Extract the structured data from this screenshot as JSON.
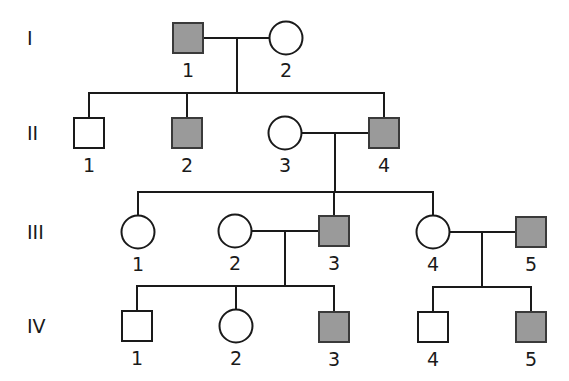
{
  "diagram": {
    "type": "pedigree",
    "colors": {
      "affected_fill": "#9a9a9a",
      "unaffected_fill": "#ffffff",
      "stroke": "#1a1a1a"
    },
    "generations": [
      {
        "label": "I",
        "y": 38
      },
      {
        "label": "II",
        "y": 133
      },
      {
        "label": "III",
        "y": 232
      },
      {
        "label": "IV",
        "y": 326
      }
    ],
    "individuals": [
      {
        "id": "I-1",
        "gen": "I",
        "num": "1",
        "sex": "male",
        "affected": true,
        "x": 188,
        "y": 38
      },
      {
        "id": "I-2",
        "gen": "I",
        "num": "2",
        "sex": "female",
        "affected": false,
        "x": 286,
        "y": 38
      },
      {
        "id": "II-1",
        "gen": "II",
        "num": "1",
        "sex": "male",
        "affected": false,
        "x": 89,
        "y": 133
      },
      {
        "id": "II-2",
        "gen": "II",
        "num": "2",
        "sex": "male",
        "affected": true,
        "x": 187,
        "y": 133
      },
      {
        "id": "II-3",
        "gen": "II",
        "num": "3",
        "sex": "female",
        "affected": false,
        "x": 285,
        "y": 133
      },
      {
        "id": "II-4",
        "gen": "II",
        "num": "4",
        "sex": "male",
        "affected": true,
        "x": 384,
        "y": 133
      },
      {
        "id": "III-1",
        "gen": "III",
        "num": "1",
        "sex": "female",
        "affected": false,
        "x": 138,
        "y": 232
      },
      {
        "id": "III-2",
        "gen": "III",
        "num": "2",
        "sex": "female",
        "affected": false,
        "x": 235,
        "y": 231
      },
      {
        "id": "III-3",
        "gen": "III",
        "num": "3",
        "sex": "male",
        "affected": true,
        "x": 334,
        "y": 231
      },
      {
        "id": "III-4",
        "gen": "III",
        "num": "4",
        "sex": "female",
        "affected": false,
        "x": 433,
        "y": 232
      },
      {
        "id": "III-5",
        "gen": "III",
        "num": "5",
        "sex": "male",
        "affected": true,
        "x": 531,
        "y": 232
      },
      {
        "id": "IV-1",
        "gen": "IV",
        "num": "1",
        "sex": "male",
        "affected": false,
        "x": 137,
        "y": 326
      },
      {
        "id": "IV-2",
        "gen": "IV",
        "num": "2",
        "sex": "female",
        "affected": false,
        "x": 236,
        "y": 326
      },
      {
        "id": "IV-3",
        "gen": "IV",
        "num": "3",
        "sex": "male",
        "affected": true,
        "x": 334,
        "y": 327
      },
      {
        "id": "IV-4",
        "gen": "IV",
        "num": "4",
        "sex": "male",
        "affected": false,
        "x": 433,
        "y": 327
      },
      {
        "id": "IV-5",
        "gen": "IV",
        "num": "5",
        "sex": "male",
        "affected": true,
        "x": 531,
        "y": 327
      }
    ],
    "matings": [
      {
        "partners": [
          "I-1",
          "I-2"
        ],
        "children": [
          "II-1",
          "II-2",
          "II-4"
        ]
      },
      {
        "partners": [
          "II-3",
          "II-4"
        ],
        "children": [
          "III-1",
          "III-3",
          "III-4"
        ]
      },
      {
        "partners": [
          "III-2",
          "III-3"
        ],
        "children": [
          "IV-1",
          "IV-2",
          "IV-3"
        ]
      },
      {
        "partners": [
          "III-4",
          "III-5"
        ],
        "children": [
          "IV-4",
          "IV-5"
        ]
      }
    ]
  }
}
